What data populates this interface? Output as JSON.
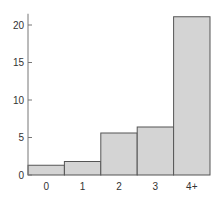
{
  "chart_data": {
    "type": "bar",
    "title": "",
    "xlabel": "",
    "ylabel": "",
    "categories": [
      "0",
      "1",
      "2",
      "3",
      "4+"
    ],
    "values": [
      1.3,
      1.8,
      5.6,
      6.4,
      21.1
    ],
    "ylim": [
      0,
      21.5
    ],
    "yticks": [
      0,
      5,
      10,
      15,
      20
    ],
    "grid": false,
    "legend": null,
    "bar_color": "#d4d4d4",
    "bar_edge_color": "#555555",
    "axis_color": "#777777"
  }
}
